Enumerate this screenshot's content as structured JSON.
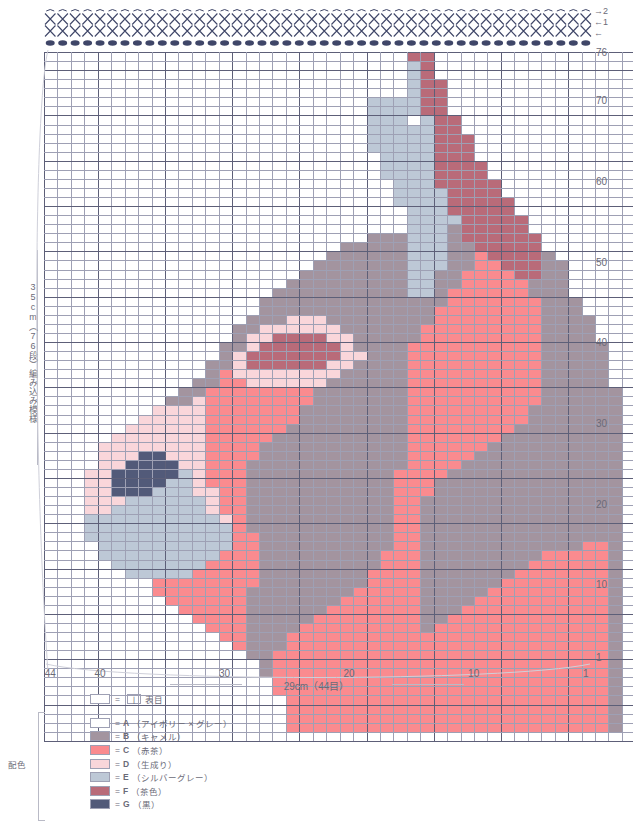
{
  "meta": {
    "top_symbol_rows": [
      {
        "symbol": "X",
        "row_label": "→2",
        "count": 44
      },
      {
        "symbol": "X",
        "row_label": "←1",
        "count": 44
      },
      {
        "symbol": "●",
        "row_label": "←",
        "count": 44
      }
    ]
  },
  "axes": {
    "right_label_top": "76",
    "right_ticks": [
      {
        "value": "76",
        "row": 76
      },
      {
        "value": "70",
        "row": 70
      },
      {
        "value": "60",
        "row": 60
      },
      {
        "value": "50",
        "row": 50
      },
      {
        "value": "40",
        "row": 40
      },
      {
        "value": "30",
        "row": 30
      },
      {
        "value": "20",
        "row": 20
      },
      {
        "value": "10",
        "row": 10
      },
      {
        "value": "1",
        "row": 1
      }
    ],
    "bottom_ticks": [
      {
        "value": "44",
        "col": 44
      },
      {
        "value": "40",
        "col": 40
      },
      {
        "value": "30",
        "col": 30
      },
      {
        "value": "20",
        "col": 20
      },
      {
        "value": "10",
        "col": 10
      },
      {
        "value": "1",
        "col": 1
      }
    ],
    "bottom_caption": "29cm（44目）",
    "left_caption": "35cm（76段）編み込み模様"
  },
  "legend": {
    "stitch_row": {
      "swatch": "",
      "equals": "=",
      "symbol_box": "丨",
      "label": "表目"
    },
    "group_label": "配色",
    "colors": [
      {
        "key": "A",
        "name": "（アイボリー × グレー）",
        "hex": "#ffffff"
      },
      {
        "key": "B",
        "name": "（キャメル）",
        "hex": "#a3949f"
      },
      {
        "key": "C",
        "name": "（赤茶）",
        "hex": "#fa8b8f"
      },
      {
        "key": "D",
        "name": "（生成り）",
        "hex": "#f9d6da"
      },
      {
        "key": "E",
        "name": "（シルバーグレー）",
        "hex": "#bdc8d6"
      },
      {
        "key": "F",
        "name": "（茶色）",
        "hex": "#b96b79"
      },
      {
        "key": "G",
        "name": "（黒）",
        "hex": "#525a79"
      }
    ]
  },
  "chart_data": {
    "type": "heatmap",
    "xlabel": "29cm（44目）",
    "ylabel": "35cm（76段）",
    "cols": 44,
    "rows": 76,
    "palette": {
      "A": "#ffffff",
      "B": "#a3949f",
      "C": "#fa8b8f",
      "D": "#f9d6da",
      "E": "#bdc8d6",
      "F": "#b96b79",
      "G": "#525a79"
    },
    "col_numbering": "right-to-left (col 1 at right edge)",
    "row_numbering": "bottom-to-top (row 1 at bottom)",
    "grid_top_to_bottom": [
      "AAAAAAAAAAAAAAAAAAAAAAAAAAAFFAAAAAAAAAAAAAAA",
      "AAAAAAAAAAAAAAAAAAAAAAAAAAAEFAAAAAAAAAAAAAAA",
      "AAAAAAAAAAAAAAAAAAAAAAAAAAAEFAAAAAAAAAAAAAAA",
      "AAAAAAAAAAAAAAAAAAAAAAAAAAAEFFAAAAAAAAAAAAAA",
      "AAAAAAAAAAAAAAAAAAAAAAAAAAAEFFAAAAAAAAAAAAAA",
      "AAAAAAAAAAAAAAAAAAAAAAAAEEEEFFAAAAAAAAAAAAAA",
      "AAAAAAAAAAAAAAAAAAAAAAAAEEEEFFAAAAAAAAAAAAAA",
      "AAAAAAAAAAAAAAAAAAAAAAAAEEEAEFFAAAAAAAAAAAAA",
      "AAAAAAAAAAAAAAAAAAAAAAAAEEEEEFFAAAAAAAAAAAAA",
      "AAAAAAAAAAAAAAAAAAAAAAAAEEEEEFFFAAAAAAAAAAAA",
      "AAAAAAAAAAAAAAAAAAAAAAAAEEEEEFFFAAAAAAAAAAAA",
      "AAAAAAAAAAAAAAAAAAAAAAAAAEEEEFFFAAAAAAAAAAAA",
      "AAAAAAAAAAAAAAAAAAAAAAAAAEEEEFFFFAAAAAAAAAAA",
      "AAAAAAAAAAAAAAAAAAAAAAAAAEEEEFFFFAAAAAAAAAAA",
      "AAAAAAAAAAAAAAAAAAAAAAAAAAEEEFFFFFAAAAAAAAAA",
      "AAAAAAAAAAAAAAAAAAAAAAAAAAEEEEFFFFAAAAAAAAAA",
      "AAAAAAAAAAAAAAAAAAAAAAAAAAEEEEFFFFFAAAAAAAAA",
      "AAAAAAAAAAAAAAAAAAAAAAAAAAAEEEFFFFFAAAAAAAAA",
      "AAAAAAAAAAAAAAAAAAAAAAAAAAAEEEEFFFFFAAAAAAAA",
      "AAAAAAAAAAAAAAAAAAAAAAAAAAAEEEBFFFFFAAAAAAAA",
      "AAAAAAAAAAAAAAAAAAAAAAAABBBEEEBFFFFFFAAAAAAA",
      "AAAAAAAAAAAAAAAAAAAAAABBBBBEEEBBFFFFFAAAAAAA",
      "AAAAAAAAAAAAAAAAAAAAABBBBBBEEEBBCFFFFBAAAAAA",
      "AAAAAAAAAAAAAAAAAAAABBBBBBBEEEBBCCFFFBBAAAAA",
      "AAAAAAAAAAAAAAAAAAABBBBBBBBEEBBCCCCFFBBAAAAA",
      "AAAAAAAAAAAAAAAAAABBBBBBBBBEEBBCCCCCBBBAAAAA",
      "AAAAAAAAAAAAAAAAABBBBBBBBBBEEBCCCCCCBBBAAAAA",
      "AAAAAAAAAAAAAAAABBBBBBBBBBBBBBCCCCCCCBBBAAAA",
      "AAAAAAAAAAAAAAAABBBBBBBBBBBBBCCCCCCCCBBBAAAA",
      "AAAAAAAAAAAAAAABBBDDDBBBBBBBBCCCCCCCCBBBBAAA",
      "AAAAAAAAAAAAAABBDDDDDDBBBBBBCCCCCCCCCBBBBAAA",
      "AAAAAAAAAAAAAABDDFFFFDDBBBBBCCCCCCCCCBBBBAAA",
      "AAAAAAAAAAAAABBDFFFFFFDBBBBCCCCCCCCCCBBBBBAA",
      "AAAAAAAAAAAAABDFFFFFFFDDBBBCCCCCCCCCCBBBBBAA",
      "AAAAAAAAAAAABBDFFFFFFDDBBBBCCCCCCCCCCBBBBBAA",
      "AAAAAAAAAAAABCDDDDDDDDBBBBBCCCCCCCCCCBBBBBAA",
      "AAAAAAAAAAABBCCDDDDDDBBBBBBCCCCCCCCCCBBBBBAA",
      "AAAAAAAAAABBCCCCCCCCBBBBBBBCCCCCCCCCCBBBBBBA",
      "AAAAAAAAABBDCCCCCCCCBBBBBBBCCCCCCCCCCBBBBBBA",
      "AAAAAAAADDDDCCCCCCCBBBBBBBBCCCCCCCCCBBBBBBBA",
      "AAAAAAADDDDDCCCCCCCBBBBBBBBCCCCCCCCCBBBBBBBA",
      "AAAAAADDDDDDCCCCCCBBBBBBBBBCCCCCCCCBBBBBBBBA",
      "AAAAADDDDDDDCCCCCBBBBBBBBBBCCCCCCCBBBBBBBBBA",
      "AAAADDDDDDDDCCCCBBBBBBBBBBBCCCCCCBBBBBBBBBBA",
      "AAAADDDGGDDDCCCCBBBBBBBBBBBCCCCCBBBBBBBBBBBA",
      "AAAADDGGGGDDCCCBBBBBBBBBBBBCCCCBBBBBBBBBBBBA",
      "AAADDGGGGGEDCCCBBBBBBBBBBBCCCCBBBBBBBBBBBBBA",
      "AAADDGGGGEEDCCCBBBBBBBBBBBCCCBBBBBBBBBBBBBBA",
      "AAADDGGGEEEDDCCBBBBBBBBBBBCCCBBBBBBBBBBBBBBA",
      "AAADDDEEEEEEDCCBBBBBBBBBBBCCBBBBBBBBBBBBBBBA",
      "AAADDEEEEEEEDCCBBBBBBBBBBBCCBBBBBBBBBBBBBBBA",
      "AAAEEEEEEEEEEDCBBBBBBBBBBBCCBBBBBBBBBBBBBBBA",
      "AAAEEEEEEEEEEECBBBBBBBBBBBCCBBBBBBBBBBBBBBBA",
      "AAAEEEEEEEEEEECCBBBBBBBBBBCCBBBBBBBBBBBBBBBA",
      "AAAAEEEEEEEEEECCBBBBBBBBBBCCBBBBBBBBBBBBCCBA",
      "AAAAEEEEEEEEECCCBBBBBBBBBCCCBBBBBBBBBCCCCCBA",
      "AAAAAEEEEEEECCCCBBBBBBBBBCCCBBBBBBBBCCCCCCBA",
      "AAAAAAEEEEECCCCCBBBBBBBBCCCCBBBBBBBCCCCCCCBA",
      "AAAAAAAACCCCCCCCBBBBBBBBCCCCBBBBBBCCCCCCCCBA",
      "AAAAAAAACCCCCCCBBBBBBBBCCCCCBBBBBCCCCCCCCCBA",
      "AAAAAAAAACCCCCCBBBBBBBCCCCCCBBBBCCCCCCCCCCBA",
      "AAAAAAAAAACCCCCBBBBBBCCCCCCCBBBCCCCCCCCCCCBA",
      "AAAAAAAAAAACCCCBBBBBCCCCCCCCBBCCCCCCCCCCCCBA",
      "AAAAAAAAAAAACCCBBBBCCCCCCCCCBCCCCCCCCCCCCCBA",
      "AAAAAAAAAAAAACCBBBCCCCCCCCCCCCCCCCCCCCCCCCBA",
      "AAAAAAAAAAAAAACBBBCCCCCCCCCCCCCCCCCCCCCCCCBA",
      "AAAAAAAAAAAAAAABBCCCCCCCCCCCCCCCCCCCCCCCCCBA",
      "AAAAAAAAAAAAAAAABCCCCCCCCCCCCCCCCCCCCCCCCCBA",
      "AAAAAAAAAAAAAAAABCCCCCCCCCCCCCCCCCCCCCCCCCBA",
      "AAAAAAAAAAAAAAAAACCCCCCCCCCCCCCCCCCCCCCCCCBA",
      "AAAAAAAAAAAAAAAAACCCCCCCCCCCCCCCCCCCCCCCCCBA",
      "AAAAAAAAAAAAAAAAAACCCCCCCCCCCCCCCCCCCCCCCCBA",
      "AAAAAAAAAAAAAAAAAACCCCCCCCCCCCCCCCCCCCCCCCBA",
      "AAAAAAAAAAAAAAAAAACCCCCCCCCCCCCCCCCCCCCCCCBA",
      "AAAAAAAAAAAAAAAAAACCCCCCCCCCCCCCCCCCCCCCCCBA",
      "AAAAAAAAAAAAAAAAAAAAAAAAAAAAAAAAAAAAAAAAAAAA"
    ]
  }
}
